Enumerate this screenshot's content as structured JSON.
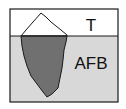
{
  "diagram": {
    "type": "iceberg",
    "top_label": "T",
    "bottom_label": "AFB",
    "colors": {
      "sky": "#ffffff",
      "water": "#d8d8d8",
      "iceberg_submerged": "#707070",
      "iceberg_visible": "#ffffff",
      "outline": "#1a1a1a"
    }
  }
}
